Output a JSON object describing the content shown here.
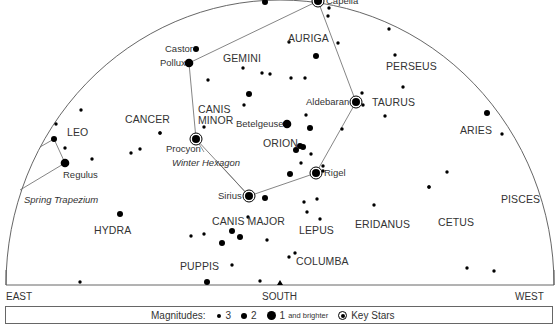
{
  "chart_data": {
    "type": "scatter",
    "directions": {
      "east": "EAST",
      "south": "SOUTH",
      "west": "WEST"
    },
    "constellations": [
      {
        "name": "GEMINI",
        "x": 223,
        "y": 58
      },
      {
        "name": "AURIGA",
        "x": 288,
        "y": 38
      },
      {
        "name": "PERSEUS",
        "x": 386,
        "y": 66
      },
      {
        "name": "TAURUS",
        "x": 372,
        "y": 102
      },
      {
        "name": "ARIES",
        "x": 460,
        "y": 130
      },
      {
        "name": "CANCER",
        "x": 125,
        "y": 119
      },
      {
        "name": "CANIS MINOR",
        "x": 198,
        "y": 108
      },
      {
        "name": "ORION",
        "x": 263,
        "y": 143
      },
      {
        "name": "LEO",
        "x": 67,
        "y": 132
      },
      {
        "name": "CANIS MAJOR",
        "x": 212,
        "y": 221
      },
      {
        "name": "LEPUS",
        "x": 299,
        "y": 230
      },
      {
        "name": "ERIDANUS",
        "x": 355,
        "y": 224
      },
      {
        "name": "CETUS",
        "x": 438,
        "y": 222
      },
      {
        "name": "PISCES",
        "x": 501,
        "y": 199
      },
      {
        "name": "HYDRA",
        "x": 94,
        "y": 230
      },
      {
        "name": "COLUMBA",
        "x": 296,
        "y": 261
      },
      {
        "name": "PUPPIS",
        "x": 180,
        "y": 266
      }
    ],
    "key_stars": [
      {
        "name": "Capella",
        "x": 318,
        "y": 1
      },
      {
        "name": "Aldebaran",
        "x": 356,
        "y": 102
      },
      {
        "name": "Procyon",
        "x": 196,
        "y": 139
      },
      {
        "name": "Rigel",
        "x": 316,
        "y": 173
      },
      {
        "name": "Sirius",
        "x": 249,
        "y": 196
      }
    ],
    "named_stars": [
      {
        "name": "Castor",
        "x": 196,
        "y": 49,
        "mag": 2
      },
      {
        "name": "Pollux",
        "x": 189,
        "y": 63,
        "mag": 1
      },
      {
        "name": "Betelgeuse",
        "x": 287,
        "y": 124,
        "mag": 1
      },
      {
        "name": "Regulus",
        "x": 65,
        "y": 163,
        "mag": 1
      }
    ],
    "asterisms": [
      {
        "name": "Winter Hexagon",
        "label_x": 172,
        "label_y": 158,
        "points": [
          [
            318,
            1
          ],
          [
            356,
            102
          ],
          [
            316,
            173
          ],
          [
            249,
            196
          ],
          [
            196,
            139
          ],
          [
            189,
            63
          ],
          [
            318,
            1
          ]
        ]
      },
      {
        "name": "Spring Trapezium",
        "label_x": 24,
        "label_y": 195,
        "points": [
          [
            40,
            147
          ],
          [
            54,
            139
          ],
          [
            65,
            163
          ],
          [
            20,
            190
          ]
        ]
      }
    ],
    "stars": [
      {
        "x": 265,
        "y": 2,
        "mag": 2
      },
      {
        "x": 329,
        "y": 8,
        "mag": 3
      },
      {
        "x": 328,
        "y": 16,
        "mag": 3
      },
      {
        "x": 289,
        "y": 42,
        "mag": 3
      },
      {
        "x": 338,
        "y": 43,
        "mag": 3
      },
      {
        "x": 316,
        "y": 56,
        "mag": 2
      },
      {
        "x": 305,
        "y": 78,
        "mag": 3
      },
      {
        "x": 389,
        "y": 29,
        "mag": 3
      },
      {
        "x": 395,
        "y": 55,
        "mag": 3
      },
      {
        "x": 403,
        "y": 87,
        "mag": 3
      },
      {
        "x": 362,
        "y": 93,
        "mag": 3
      },
      {
        "x": 363,
        "y": 105,
        "mag": 3
      },
      {
        "x": 385,
        "y": 116,
        "mag": 3
      },
      {
        "x": 306,
        "y": 115,
        "mag": 3
      },
      {
        "x": 310,
        "y": 128,
        "mag": 2
      },
      {
        "x": 342,
        "y": 129,
        "mag": 3
      },
      {
        "x": 243,
        "y": 68,
        "mag": 3
      },
      {
        "x": 262,
        "y": 73,
        "mag": 3
      },
      {
        "x": 270,
        "y": 74,
        "mag": 3
      },
      {
        "x": 208,
        "y": 80,
        "mag": 3
      },
      {
        "x": 249,
        "y": 94,
        "mag": 2
      },
      {
        "x": 244,
        "y": 105,
        "mag": 3
      },
      {
        "x": 291,
        "y": 78,
        "mag": 3
      },
      {
        "x": 204,
        "y": 127,
        "mag": 3
      },
      {
        "x": 160,
        "y": 133,
        "mag": 3
      },
      {
        "x": 140,
        "y": 149,
        "mag": 3
      },
      {
        "x": 131,
        "y": 153,
        "mag": 3
      },
      {
        "x": 92,
        "y": 159,
        "mag": 3
      },
      {
        "x": 81,
        "y": 110,
        "mag": 3
      },
      {
        "x": 56,
        "y": 124,
        "mag": 3
      },
      {
        "x": 54,
        "y": 139,
        "mag": 2
      },
      {
        "x": 65,
        "y": 148,
        "mag": 3
      },
      {
        "x": 296,
        "y": 150,
        "mag": 2
      },
      {
        "x": 303,
        "y": 147,
        "mag": 2
      },
      {
        "x": 300,
        "y": 146,
        "mag": 2
      },
      {
        "x": 311,
        "y": 154,
        "mag": 3
      },
      {
        "x": 301,
        "y": 163,
        "mag": 3
      },
      {
        "x": 290,
        "y": 174,
        "mag": 2
      },
      {
        "x": 323,
        "y": 166,
        "mag": 3
      },
      {
        "x": 323,
        "y": 171,
        "mag": 3
      },
      {
        "x": 265,
        "y": 198,
        "mag": 2
      },
      {
        "x": 304,
        "y": 202,
        "mag": 3
      },
      {
        "x": 317,
        "y": 199,
        "mag": 3
      },
      {
        "x": 307,
        "y": 212,
        "mag": 3
      },
      {
        "x": 320,
        "y": 219,
        "mag": 3
      },
      {
        "x": 248,
        "y": 217,
        "mag": 3
      },
      {
        "x": 232,
        "y": 231,
        "mag": 2
      },
      {
        "x": 240,
        "y": 237,
        "mag": 2
      },
      {
        "x": 222,
        "y": 243,
        "mag": 2
      },
      {
        "x": 191,
        "y": 236,
        "mag": 3
      },
      {
        "x": 204,
        "y": 234,
        "mag": 3
      },
      {
        "x": 267,
        "y": 240,
        "mag": 3
      },
      {
        "x": 232,
        "y": 265,
        "mag": 3
      },
      {
        "x": 289,
        "y": 257,
        "mag": 3
      },
      {
        "x": 295,
        "y": 253,
        "mag": 3
      },
      {
        "x": 374,
        "y": 205,
        "mag": 3
      },
      {
        "x": 429,
        "y": 187,
        "mag": 3
      },
      {
        "x": 447,
        "y": 172,
        "mag": 3
      },
      {
        "x": 120,
        "y": 214,
        "mag": 2
      },
      {
        "x": 80,
        "y": 282,
        "mag": 3
      },
      {
        "x": 207,
        "y": 282,
        "mag": 2
      },
      {
        "x": 260,
        "y": 281,
        "mag": 3
      },
      {
        "x": 467,
        "y": 268,
        "mag": 3
      },
      {
        "x": 494,
        "y": 271,
        "mag": 3
      },
      {
        "x": 487,
        "y": 113,
        "mag": 2
      },
      {
        "x": 502,
        "y": 134,
        "mag": 3
      },
      {
        "x": 429,
        "y": 187,
        "mag": 3
      },
      {
        "x": 160,
        "y": 133,
        "mag": 3
      }
    ],
    "horizon_y": 285,
    "south_marker_x": 280
  },
  "legend": {
    "title": "Magnitudes:",
    "items": [
      {
        "label": "3",
        "size": 4
      },
      {
        "label": "2",
        "size": 6
      },
      {
        "label": "1",
        "suffix": "and brighter",
        "size": 9
      }
    ],
    "key_label": "Key Stars"
  }
}
